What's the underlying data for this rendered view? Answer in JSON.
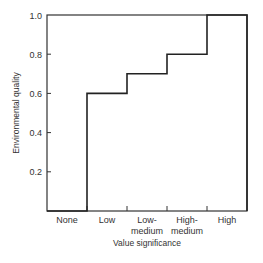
{
  "chart_data": {
    "type": "line",
    "subtype": "step",
    "title": "",
    "xlabel": "Value significance",
    "ylabel": "Environmental quality",
    "categories": [
      "None",
      "Low",
      "Low-\nmedium",
      "High-\nmedium",
      "High"
    ],
    "category_lines": [
      [
        "None"
      ],
      [
        "Low"
      ],
      [
        "Low-",
        "medium"
      ],
      [
        "High-",
        "medium"
      ],
      [
        "High"
      ]
    ],
    "values": [
      0.0,
      0.6,
      0.7,
      0.8,
      1.0
    ],
    "yticks": [
      "0.2",
      "0.4",
      "0.6",
      "0.8",
      "1.0"
    ],
    "ytick_values": [
      0.2,
      0.4,
      0.6,
      0.8,
      1.0
    ],
    "ylim": [
      0,
      1.0
    ],
    "grid": false,
    "legend": null,
    "line_color": "#222222"
  }
}
